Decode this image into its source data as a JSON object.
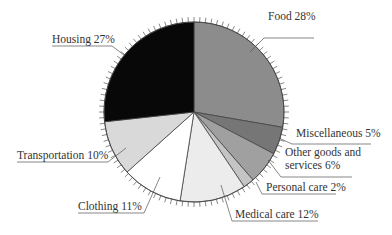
{
  "chart_data": {
    "type": "pie",
    "title": "",
    "categories": [
      "Food",
      "Miscellaneous",
      "Other goods and services",
      "Personal care",
      "Medical care",
      "Clothing",
      "Transportation",
      "Housing"
    ],
    "values": [
      28,
      5,
      6,
      2,
      12,
      11,
      10,
      27
    ],
    "unit": "%",
    "start_angle_deg": 0,
    "direction": "clockwise",
    "colors": [
      "#8c8c8c",
      "#767676",
      "#a0a0a0",
      "#c4c4c4",
      "#ececec",
      "#ffffff",
      "#d9d9d9",
      "#080808"
    ],
    "labels": [
      {
        "lines": [
          "Food 28%"
        ],
        "x": 268,
        "y": 20,
        "anchor": "start",
        "leader": [
          [
            250,
            52
          ],
          [
            264,
            38
          ],
          [
            314,
            38
          ]
        ]
      },
      {
        "lines": [
          "Miscellaneous 5%"
        ],
        "x": 296,
        "y": 137,
        "anchor": "start",
        "leader": [
          [
            279,
            138
          ],
          [
            292,
            144
          ],
          [
            371,
            144
          ]
        ]
      },
      {
        "lines": [
          "Other goods and",
          "services 6%"
        ],
        "x": 285,
        "y": 156,
        "anchor": "start",
        "leader": [
          [
            268,
            160
          ],
          [
            281,
            177
          ],
          [
            352,
            177
          ]
        ]
      },
      {
        "lines": [
          "Personal care 2%"
        ],
        "x": 266,
        "y": 191,
        "anchor": "start",
        "leader": [
          [
            256,
            182
          ],
          [
            262,
            194
          ],
          [
            336,
            194
          ]
        ]
      },
      {
        "lines": [
          "Medical care 12%"
        ],
        "x": 235,
        "y": 218,
        "anchor": "start",
        "leader": [
          [
            221,
            185
          ],
          [
            232,
            221
          ],
          [
            318,
            221
          ]
        ]
      },
      {
        "lines": [
          "Clothing 11%"
        ],
        "x": 78,
        "y": 210,
        "anchor": "start",
        "leader": [
          [
            160,
            177
          ],
          [
            144,
            213
          ],
          [
            78,
            213
          ]
        ]
      },
      {
        "lines": [
          "Transportation 10%"
        ],
        "x": 17,
        "y": 159,
        "anchor": "start",
        "leader": [
          [
            126,
            148
          ],
          [
            108,
            162
          ],
          [
            17,
            162
          ]
        ]
      },
      {
        "lines": [
          "Housing 27%"
        ],
        "x": 52,
        "y": 43,
        "anchor": "start",
        "leader": [
          [
            124,
            55
          ],
          [
            112,
            46
          ],
          [
            52,
            46
          ]
        ]
      }
    ],
    "legend": "none",
    "grid": false
  },
  "geometry": {
    "cx": 194,
    "cy": 112,
    "r": 90,
    "ticks": 100
  }
}
